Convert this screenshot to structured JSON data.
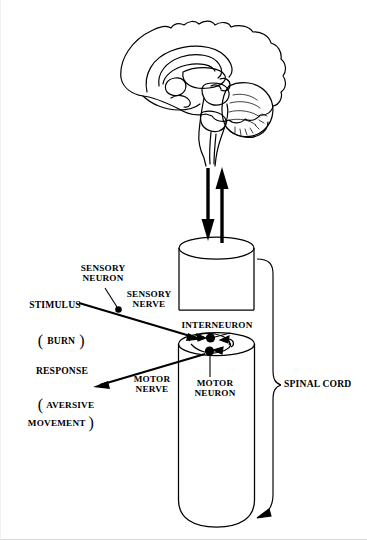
{
  "figure": {
    "background_color": "#ffffff",
    "ink_color": "#000000"
  },
  "labels": {
    "sensory_neuron": "SENSORY\nNEURON",
    "sensory_nerve": "SENSORY\nNERVE",
    "stimulus": "STIMULUS",
    "stimulus_detail_open": "(",
    "stimulus_detail": "BURN",
    "stimulus_detail_close": ")",
    "interneuron": "INTERNEURON",
    "response": "RESPONSE",
    "response_detail_open": "(",
    "response_detail": "AVERSIVE\nMOVEMENT",
    "response_detail_close": ")",
    "motor_nerve": "MOTOR\nNERVE",
    "motor_neuron": "MOTOR\nNEURON",
    "spinal_cord": "SPINAL CORD"
  },
  "structures": {
    "brain": "midsagittal-brain-section",
    "upper_cord_segment": "spinal-cord-upper-cylinder",
    "lower_cord_segment": "spinal-cord-lower-cylinder",
    "ascending_arrow": "ascending-tract-arrow-up",
    "descending_arrow": "descending-tract-arrow-down",
    "synapse_dots": 2,
    "bracket": "spinal-cord-bracket"
  }
}
